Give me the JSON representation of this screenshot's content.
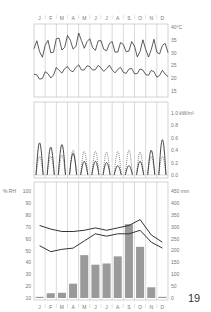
{
  "months": [
    "J",
    "F",
    "M",
    "A",
    "M",
    "J",
    "J",
    "A",
    "S",
    "O",
    "N",
    "D"
  ],
  "page_number": "19",
  "chart_data": [
    {
      "type": "line",
      "title": "Daily temperature",
      "ylabel": "°C",
      "ylim": [
        13,
        41
      ],
      "yticks": [
        "40°C",
        "35",
        "30",
        "25",
        "20",
        "15"
      ],
      "ytick_values": [
        40,
        35,
        30,
        25,
        20,
        15
      ],
      "series": [
        {
          "name": "Daily maximum",
          "monthly_mean": [
            31.5,
            32,
            33.5,
            34,
            34.5,
            33,
            32.5,
            32,
            32,
            31.5,
            31.5,
            31.5
          ],
          "amplitude": 3
        },
        {
          "name": "Daily minimum",
          "monthly_mean": [
            20.5,
            21.5,
            23,
            23.5,
            24,
            24,
            23.5,
            23,
            23,
            22.5,
            22,
            21.5
          ],
          "amplitude": 1.2
        }
      ],
      "grid": "vertical month dividers"
    },
    {
      "type": "line",
      "title": "Solar radiation daily profile",
      "ylabel": "kW/m²",
      "ylim": [
        0,
        1.0
      ],
      "yticks": [
        "1.0 kW/m²",
        "0.8",
        "0.6",
        "0.4",
        "0.2",
        "0.0"
      ],
      "ytick_values": [
        1.0,
        0.8,
        0.6,
        0.4,
        0.2,
        0.0
      ],
      "series": [
        {
          "name": "Direct (solid)",
          "peak": [
            0.52,
            0.45,
            0.49,
            0.35,
            0.22,
            0.22,
            0.2,
            0.15,
            0.15,
            0.22,
            0.4,
            0.57
          ]
        },
        {
          "name": "Diffuse (dotted)",
          "peak": [
            0.3,
            0.3,
            0.32,
            0.4,
            0.38,
            0.38,
            0.37,
            0.38,
            0.4,
            0.37,
            0.3,
            0.3
          ]
        }
      ]
    },
    {
      "type": "bar",
      "title": "Relative humidity and rainfall",
      "categories": [
        "J",
        "F",
        "M",
        "A",
        "M",
        "J",
        "J",
        "A",
        "S",
        "O",
        "N",
        "D"
      ],
      "ylabel_left": "% RH",
      "ylim_left": [
        10,
        100
      ],
      "yticks_left": [
        "100",
        "90",
        "80",
        "70",
        "60",
        "50",
        "40",
        "30",
        "20",
        "10"
      ],
      "yticks_left_values": [
        100,
        90,
        80,
        70,
        60,
        50,
        40,
        30,
        20,
        10
      ],
      "ylabel_right": "mm",
      "ylim_right": [
        0,
        450
      ],
      "yticks_right": [
        "450 mm",
        "400",
        "350",
        "300",
        "250",
        "200",
        "150",
        "100",
        "50",
        "0"
      ],
      "yticks_right_values": [
        450,
        400,
        350,
        300,
        250,
        200,
        150,
        100,
        50,
        0
      ],
      "series": [
        {
          "name": "Rainfall (mm)",
          "type": "bar",
          "values": [
            5,
            20,
            22,
            60,
            180,
            140,
            145,
            175,
            310,
            215,
            45,
            5
          ]
        },
        {
          "name": "RH maximum (%)",
          "type": "line",
          "values": [
            71,
            68,
            66,
            66,
            67,
            69,
            67,
            69,
            71,
            76,
            63,
            57
          ]
        },
        {
          "name": "RH minimum (%)",
          "type": "line",
          "values": [
            54,
            49,
            51,
            52,
            58,
            64,
            62,
            64,
            64,
            67,
            57,
            52
          ]
        }
      ]
    }
  ],
  "colors": {
    "line": "#333333",
    "bar": "#9a9a9a",
    "grid": "#b5b5b5",
    "text": "#777777"
  }
}
